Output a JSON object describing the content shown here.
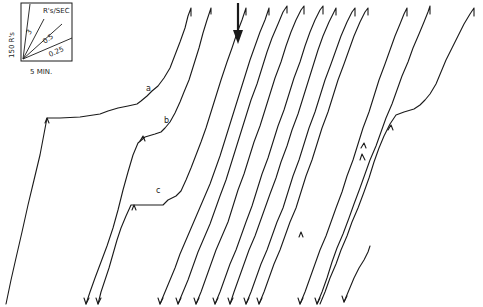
{
  "legend": {
    "y_scale_label": "150 R's",
    "x_scale_label": "5 MIN.",
    "rate_unit_label": "R's/SEC",
    "rate_lines": [
      {
        "label": "3"
      },
      {
        "label": "0.5"
      },
      {
        "label": "0.25"
      }
    ]
  },
  "annotations": {
    "a": "a",
    "b": "b",
    "c": "c"
  },
  "figure": {
    "type": "cumulative-record",
    "num_segments": 14,
    "stroke_color": "#1a1a1a",
    "background": "#ffffff"
  }
}
